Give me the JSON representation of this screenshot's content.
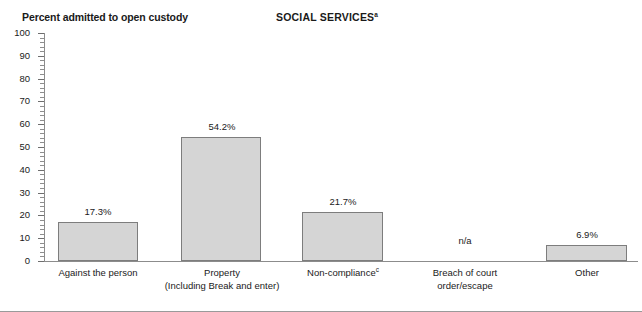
{
  "chart_data": {
    "type": "bar",
    "title": "SOCIAL SERVICES",
    "title_superscript": "a",
    "ylabel": "Percent admitted to open custody",
    "xlabel": "",
    "ylim": [
      0,
      100
    ],
    "ytick_step": 10,
    "grid": false,
    "legend": "none",
    "categories": [
      "Against the person",
      "Property",
      "Non-compliance",
      "Breach of court order/escape",
      "Other"
    ],
    "category_lines": [
      [
        "Against the person"
      ],
      [
        "Property",
        "(Including Break and enter)"
      ],
      [
        "Non-compliance"
      ],
      [
        "Breach of court",
        "order/escape"
      ],
      [
        "Other"
      ]
    ],
    "category_superscripts": [
      "",
      "",
      "c",
      "",
      ""
    ],
    "values": [
      17.3,
      54.2,
      21.7,
      null,
      6.9
    ],
    "value_labels": [
      "17.3%",
      "54.2%",
      "21.7%",
      "n/a",
      "6.9%"
    ],
    "ytick_labels": [
      "0",
      "10",
      "20",
      "30",
      "40",
      "50",
      "60",
      "70",
      "80",
      "90",
      "100"
    ],
    "bar_color": "#d5d5d5",
    "bar_border_color": "#7d7d7d",
    "axis_color": "#8c8c8c"
  }
}
